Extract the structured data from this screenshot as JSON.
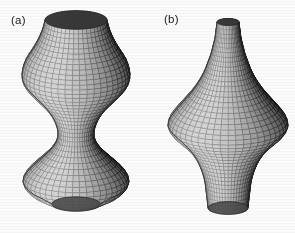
{
  "figure": {
    "background_color": "#fbfbfa",
    "ink_color": "#23211f",
    "width": 295,
    "height": 233,
    "panels": [
      {
        "id": "a",
        "label": "(a)",
        "shape_name": "unduloid",
        "description": "Hourglass-like surface of revolution: wide flared cap at top, narrow waist in the middle, wide flared bell at the bottom closed by a rounded cap.",
        "render": "wireframe mesh with shaded quadrilateral facets",
        "label_position": {
          "x": 11,
          "y": 14
        }
      },
      {
        "id": "b",
        "label": "(b)",
        "shape_name": "spindle",
        "description": "Spindle-like surface of revolution: narrow rounded neck at top, broad bulging equator in the middle, tapering to a narrow truncated tube at the bottom.",
        "render": "wireframe mesh with shaded quadrilateral facets",
        "label_position": {
          "x": 164,
          "y": 13
        }
      }
    ]
  },
  "chart_data": {
    "type": "line",
    "xlabel": "radius r (px)",
    "ylabel": "height y (px)",
    "grid": false,
    "legend": "none",
    "series": [
      {
        "name": "(a) unduloid profile",
        "axis_x": 76,
        "y": [
          20,
          28,
          36,
          44,
          52,
          60,
          68,
          76,
          84,
          92,
          100,
          108,
          116,
          124,
          132,
          140,
          148,
          156,
          164,
          172,
          180,
          188,
          196,
          204
        ],
        "radius": [
          31,
          33,
          36,
          40,
          45,
          50,
          53,
          54,
          52,
          46,
          38,
          30,
          24,
          20,
          18,
          19,
          24,
          32,
          41,
          49,
          53,
          50,
          40,
          24
        ]
      },
      {
        "name": "(b) spindle profile",
        "axis_x": 228,
        "y": [
          22,
          30,
          38,
          46,
          54,
          62,
          70,
          78,
          86,
          94,
          102,
          110,
          118,
          126,
          134,
          142,
          150,
          158,
          166,
          174,
          182,
          190,
          198,
          208
        ],
        "radius": [
          11,
          12,
          13,
          15,
          17,
          20,
          23,
          27,
          32,
          38,
          45,
          52,
          58,
          60,
          55,
          46,
          38,
          32,
          28,
          25,
          23,
          22,
          21,
          20
        ]
      }
    ]
  }
}
